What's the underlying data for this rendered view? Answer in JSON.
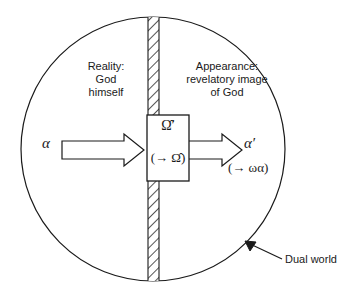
{
  "figure": {
    "background_color": "#ffffff",
    "stroke_color": "#1a1a1a"
  },
  "circle": {
    "name": "dual-world-boundary",
    "center_x": 153,
    "center_y": 149,
    "radius": 132
  },
  "divider": {
    "name": "hatched-divider-bar",
    "x": 148,
    "width": 11,
    "hatch": "diagonal",
    "description": "hatched vertical bar separating reality from appearance"
  },
  "labels": {
    "reality": "Reality:\nGod\nhimself",
    "appearance": "Appearance:\nrevelatory image\nof God",
    "dual_world": "Dual world"
  },
  "box": {
    "name": "omega-operator-box",
    "top_symbol": "Ω̂′",
    "bottom_symbol": "(→ Ω̂)"
  },
  "flow": {
    "input_symbol": "α",
    "output_symbol": "α′",
    "output_sub_symbol": "(→ ωα)",
    "input_arrow": "block-arrow-right",
    "output_arrow": "block-arrow-right"
  },
  "annotation": {
    "leader_line": "pointer from Dual world label to circle edge",
    "arrowhead": "arrowhead-icon"
  }
}
